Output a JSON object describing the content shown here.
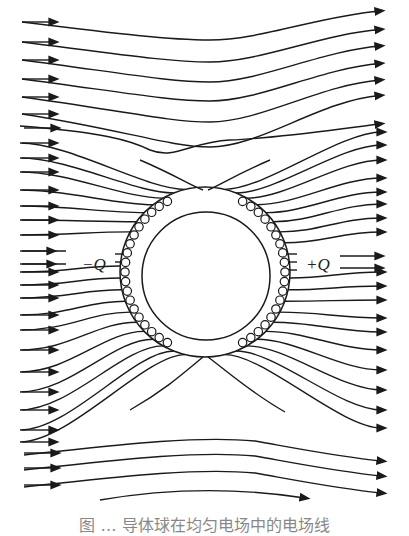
{
  "figure": {
    "colors": {
      "line": "#1a1a1a",
      "background": "#ffffff"
    },
    "labels": {
      "negative_charge": "−Q",
      "positive_charge": "+Q"
    },
    "conductor": {
      "center": [
        205,
        272
      ],
      "outer_radius": 85,
      "inner_radius": 64
    },
    "field_direction": "left-to-right",
    "induced_charge_markers": {
      "side_left": "negative",
      "side_right": "positive",
      "count_per_side": 19
    },
    "caption": "图  …  导体球在均匀电场中的电场线"
  }
}
